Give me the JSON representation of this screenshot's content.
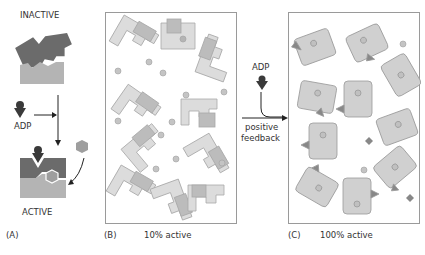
{
  "figure": {
    "panel_a": {
      "letter": "(A)",
      "top_label": "INACTIVE",
      "bottom_label": "ACTIVE",
      "effector_label": "ADP"
    },
    "panel_b": {
      "letter": "(B)",
      "caption": "10% active"
    },
    "panel_c": {
      "letter": "(C)",
      "caption": "100% active"
    },
    "arrow": {
      "effector_label": "ADP",
      "label_line1": "positive",
      "label_line2": "feedback"
    },
    "colors": {
      "dark_subunit": "#6b6b6b",
      "light_subunit": "#b4b4b4",
      "pale_subunit": "#dcdcdc",
      "ligand": "#9e9e9e",
      "effector": "#3a3a3a",
      "panel_border": "#9a9a9a"
    }
  }
}
